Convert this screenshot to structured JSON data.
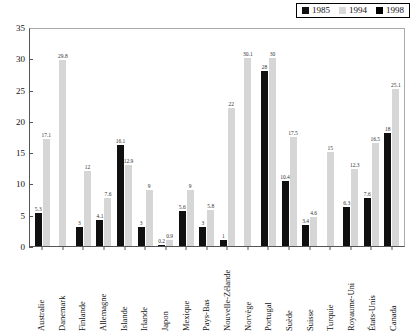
{
  "legend": {
    "entries": [
      {
        "label": "1985",
        "color": "#111111"
      },
      {
        "label": "1994",
        "color": "#d9d9d9"
      },
      {
        "label": "1998",
        "color": "#000000"
      }
    ]
  },
  "axis": {
    "y_ticks": [
      "0",
      "5",
      "10",
      "15",
      "20",
      "25",
      "30",
      "35"
    ]
  },
  "caption": "",
  "chart_data": {
    "type": "bar",
    "title": "",
    "xlabel": "",
    "ylabel": "",
    "ylim": [
      0,
      35
    ],
    "ytick_step": 5,
    "grid": false,
    "legend_position": "top-right",
    "categories": [
      "Australie",
      "Danemark",
      "Finlande",
      "Allemagne",
      "Islande",
      "Irlande",
      "Japon",
      "Mexique",
      "Pays-Bas",
      "Nouvelle-Zélande",
      "Norvège",
      "Portugal",
      "Suède",
      "Suisse",
      "Turquie",
      "Royaume-Uni",
      "États-Unis",
      "Canada"
    ],
    "series": [
      {
        "name": "1985",
        "color": "#101010",
        "values": [
          5.3,
          null,
          3,
          4.1,
          16.1,
          3,
          0.2,
          5.6,
          3,
          1,
          null,
          28,
          10.4,
          3.4,
          null,
          6.3,
          7.6,
          18
        ]
      },
      {
        "name": "1994",
        "color": "#d6d6d6",
        "values": [
          17.1,
          29.8,
          12,
          7.6,
          12.9,
          9,
          0.9,
          9,
          5.8,
          22,
          30.1,
          30,
          17.5,
          4.6,
          15,
          12.3,
          16.5,
          25.1
        ]
      }
    ],
    "labels": {
      "Australie": [
        "5.3",
        "17.1"
      ],
      "Danemark": [
        "",
        "29.8"
      ],
      "Finlande": [
        "3",
        "12"
      ],
      "Allemagne": [
        "4.1",
        "7.6"
      ],
      "Islande": [
        "16.1",
        "12.9"
      ],
      "Irlande": [
        "3",
        "9"
      ],
      "Japon": [
        "0.2",
        "0.9"
      ],
      "Mexique": [
        "5.6",
        "9"
      ],
      "Pays-Bas": [
        "3",
        "5.8"
      ],
      "Nouvelle-Zélande": [
        "1",
        "22"
      ],
      "Norvège": [
        "",
        "30.1"
      ],
      "Portugal": [
        "28",
        "30"
      ],
      "Suède": [
        "10.4",
        "17.5"
      ],
      "Suisse": [
        "3.4",
        "4.6"
      ],
      "Turquie": [
        "",
        "15"
      ],
      "Royaume-Uni": [
        "6.3",
        "12.3"
      ],
      "États-Unis": [
        "7.6",
        "16.5"
      ],
      "Canada": [
        "18",
        "25.1"
      ]
    }
  }
}
